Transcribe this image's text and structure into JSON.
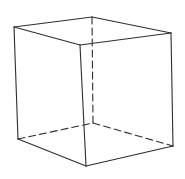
{
  "diagram": {
    "type": "wireframe-cube",
    "stroke_color": "#2e2e2e",
    "background": "#ffffff",
    "vertices": {
      "A": [
        14,
        27
      ],
      "B": [
        92,
        17
      ],
      "C": [
        171,
        33
      ],
      "D": [
        80,
        45
      ],
      "E": [
        18,
        139
      ],
      "F": [
        93,
        123
      ],
      "G": [
        173,
        146
      ],
      "H": [
        86,
        166
      ]
    },
    "visible_edges": [
      [
        "A",
        "B"
      ],
      [
        "B",
        "C"
      ],
      [
        "C",
        "D"
      ],
      [
        "D",
        "A"
      ],
      [
        "A",
        "E"
      ],
      [
        "D",
        "H"
      ],
      [
        "C",
        "G"
      ],
      [
        "E",
        "H"
      ],
      [
        "H",
        "G"
      ]
    ],
    "hidden_edges": [
      [
        "B",
        "F"
      ],
      [
        "E",
        "F"
      ],
      [
        "F",
        "G"
      ]
    ]
  }
}
